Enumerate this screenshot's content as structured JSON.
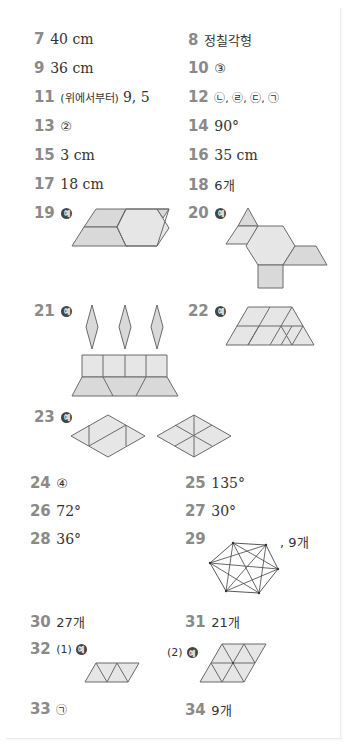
{
  "example_label": "예",
  "answers": [
    {
      "num": "7",
      "answer": "40 cm"
    },
    {
      "num": "8",
      "answer": "정칠각형"
    },
    {
      "num": "9",
      "answer": "36 cm"
    },
    {
      "num": "10",
      "answer": "③"
    },
    {
      "num": "11",
      "prefix": "(위에서부터)",
      "answer": "9, 5"
    },
    {
      "num": "12",
      "answer": "ⓛ, ⓡ, ⓒ, ⓖ"
    },
    {
      "num": "13",
      "answer": "②"
    },
    {
      "num": "14",
      "answer": "90°"
    },
    {
      "num": "15",
      "answer": "3 cm"
    },
    {
      "num": "16",
      "answer": "35 cm"
    },
    {
      "num": "17",
      "answer": "18 cm"
    },
    {
      "num": "18",
      "answer": "6개"
    },
    {
      "num": "19",
      "answer": "예",
      "figure": "parallelogram-from-hexagon-trapezoids"
    },
    {
      "num": "20",
      "answer": "예",
      "figure": "hexagon-with-attached-shapes"
    },
    {
      "num": "21",
      "answer": "예",
      "figure": "cake-with-candles"
    },
    {
      "num": "22",
      "answer": "예",
      "figure": "trapezoid-tiling"
    },
    {
      "num": "23",
      "answer": "예",
      "figure": "two-rhombus-divisions"
    },
    {
      "num": "24",
      "answer": "④"
    },
    {
      "num": "25",
      "answer": "135°"
    },
    {
      "num": "26",
      "answer": "72°"
    },
    {
      "num": "27",
      "answer": "30°"
    },
    {
      "num": "28",
      "answer": "36°"
    },
    {
      "num": "29",
      "answer": ", 9개",
      "figure": "hexagon-diagonals"
    },
    {
      "num": "30",
      "answer": "27개"
    },
    {
      "num": "31",
      "answer": "21개"
    },
    {
      "num": "32",
      "part1": "(1)",
      "part2": "(2)",
      "answer": "예",
      "figure": "triangle-parallelograms"
    },
    {
      "num": "33",
      "answer": "ⓖ"
    },
    {
      "num": "34",
      "answer": "9개"
    }
  ],
  "text": {
    "a12": "㉡, ㉣, ㉢, ㉠",
    "a33": "㉠"
  }
}
